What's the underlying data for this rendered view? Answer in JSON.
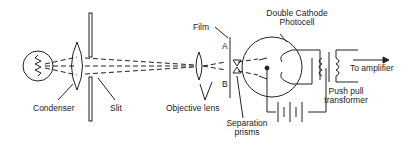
{
  "diagram": {
    "labels": {
      "condenser": "Condenser",
      "slit": "Slit",
      "objective_lens": "Objective lens",
      "film": "Film",
      "point_a": "A",
      "point_b": "B",
      "separation_prisms_line1": "Separation",
      "separation_prisms_line2": "prisms",
      "photocell_line1": "Double Cathode",
      "photocell_line2": "Photocell",
      "transformer_line1": "Push pull",
      "transformer_line2": "transformer",
      "output": "To amplifier"
    },
    "colors": {
      "stroke": "#222222",
      "background": "#ffffff"
    }
  }
}
